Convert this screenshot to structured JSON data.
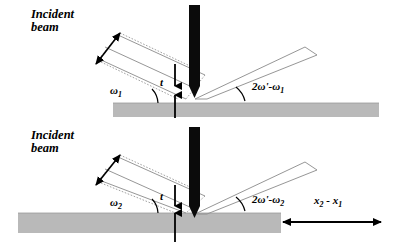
{
  "figure": {
    "colors": {
      "substrate": "#b9b9b9",
      "beam_line": "#8a8a8a",
      "ink": "#000000",
      "background": "#ffffff"
    }
  },
  "panels": [
    {
      "id": "top",
      "incident_beam_label_line1": "Incident",
      "incident_beam_label_line2": "beam",
      "incidence_angle_label": "ω",
      "incidence_angle_sub": "1",
      "thickness_label": "t",
      "exit_angle_label": "2ω'-ω",
      "exit_angle_sub": "1"
    },
    {
      "id": "bottom",
      "incident_beam_label_line1": "Incident",
      "incident_beam_label_line2": "beam",
      "incidence_angle_label": "ω",
      "incidence_angle_sub": "2",
      "thickness_label": "t",
      "exit_angle_label": "2ω'-ω",
      "exit_angle_sub": "2",
      "offset_label_a": "x",
      "offset_label_a_sub": "2",
      "offset_label_mid": " - ",
      "offset_label_b": "x",
      "offset_label_b_sub": "1"
    }
  ]
}
